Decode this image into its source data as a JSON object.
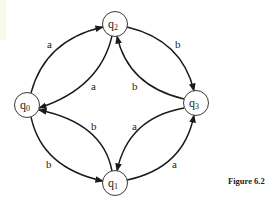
{
  "diagram": {
    "type": "finite-automaton",
    "states": [
      {
        "id": "q0",
        "base": "q",
        "sub": "0",
        "x": 27,
        "y": 105
      },
      {
        "id": "q1",
        "base": "q",
        "sub": "1",
        "x": 115,
        "y": 183
      },
      {
        "id": "q2",
        "base": "q",
        "sub": "2",
        "x": 115,
        "y": 24
      },
      {
        "id": "q3",
        "base": "q",
        "sub": "3",
        "x": 196,
        "y": 103
      }
    ],
    "transitions": [
      {
        "from": "q0",
        "to": "q2",
        "label": "a"
      },
      {
        "from": "q2",
        "to": "q0",
        "label": "a"
      },
      {
        "from": "q2",
        "to": "q3",
        "label": "b"
      },
      {
        "from": "q3",
        "to": "q2",
        "label": "b"
      },
      {
        "from": "q0",
        "to": "q1",
        "label": "b"
      },
      {
        "from": "q1",
        "to": "q0",
        "label": "b"
      },
      {
        "from": "q1",
        "to": "q3",
        "label": "a"
      },
      {
        "from": "q3",
        "to": "q1",
        "label": "a"
      }
    ]
  },
  "labels": {
    "q0": {
      "base": "q",
      "sub": "0"
    },
    "q1": {
      "base": "q",
      "sub": "1"
    },
    "q2": {
      "base": "q",
      "sub": "2"
    },
    "q3": {
      "base": "q",
      "sub": "3"
    },
    "e_q0_q2": "a",
    "e_q2_q0": "a",
    "e_q2_q3": "b",
    "e_q3_q2": "b",
    "e_q0_q1": "b",
    "e_q1_q0": "b",
    "e_q1_q3": "a",
    "e_q3_q1": "a"
  },
  "caption": "Figure  6.2"
}
